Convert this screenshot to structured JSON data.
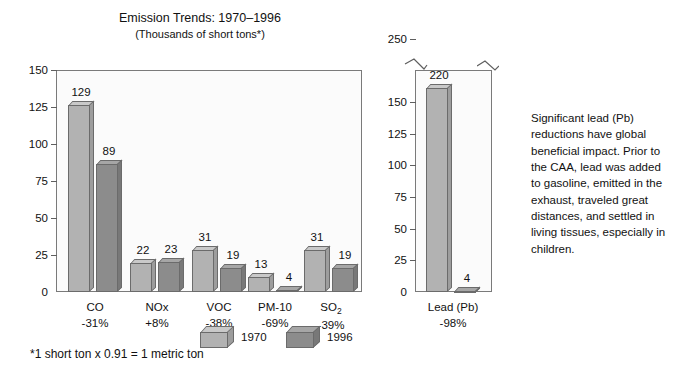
{
  "header": {
    "title": "Emission Trends: 1970–1996",
    "subtitle": "(Thousands of short tons*)"
  },
  "footnote": "*1 short ton x 0.91 = 1 metric ton",
  "side_note": "Significant lead (Pb) reductions have global beneficial impact. Prior to the CAA, lead was added to gasoline, emitted in the exhaust, traveled great distances, and settled in living tissues, especially in children.",
  "legend": {
    "items": [
      {
        "label": "1970",
        "color": "#b2b2b2"
      },
      {
        "label": "1996",
        "color": "#8c8c8c"
      }
    ]
  },
  "left_axis": {
    "ticks": [
      "0",
      "25",
      "50",
      "75",
      "100",
      "125",
      "150"
    ]
  },
  "right_axis": {
    "ticks": [
      "0",
      "25",
      "50",
      "75",
      "100",
      "125",
      "150",
      "250"
    ],
    "break_after": "150"
  },
  "categories": [
    {
      "name": "CO",
      "change": "-31%"
    },
    {
      "name": "NOx",
      "change": "+8%"
    },
    {
      "name": "VOC",
      "change": "-38%"
    },
    {
      "name": "PM-10",
      "change": "-69%"
    },
    {
      "name": "SO",
      "sub": "2",
      "change": "-39%"
    }
  ],
  "lead_category": {
    "name": "Lead (Pb)",
    "change": "-98%"
  },
  "values": {
    "co_1970": "129",
    "co_1996": "89",
    "nox_1970": "22",
    "nox_1996": "23",
    "voc_1970": "31",
    "voc_1996": "19",
    "pm10_1970": "13",
    "pm10_1996": "4",
    "so2_1970": "31",
    "so2_1996": "19",
    "lead_1970": "220",
    "lead_1996": "4"
  },
  "chart_data": {
    "type": "bar",
    "title": "Emission Trends: 1970–1996",
    "subtitle": "(Thousands of short tons*)",
    "ylabel": "Thousands of short tons",
    "xlabel": "",
    "grid": false,
    "legend_position": "bottom-center",
    "panels": [
      {
        "name": "main-pollutants",
        "ylim": [
          0,
          150
        ],
        "yticks": [
          0,
          25,
          50,
          75,
          100,
          125,
          150
        ],
        "categories": [
          "CO",
          "NOx",
          "VOC",
          "PM-10",
          "SO2"
        ],
        "category_changes": [
          "-31%",
          "+8%",
          "-38%",
          "-69%",
          "-39%"
        ],
        "series": [
          {
            "name": "1970",
            "values": [
              129,
              22,
              31,
              13,
              31
            ]
          },
          {
            "name": "1996",
            "values": [
              89,
              23,
              19,
              4,
              19
            ]
          }
        ]
      },
      {
        "name": "lead",
        "ylim": [
          0,
          250
        ],
        "yticks": [
          0,
          25,
          50,
          75,
          100,
          125,
          150,
          250
        ],
        "axis_break": true,
        "axis_break_between": [
          150,
          250
        ],
        "categories": [
          "Lead (Pb)"
        ],
        "category_changes": [
          "-98%"
        ],
        "series": [
          {
            "name": "1970",
            "values": [
              220
            ]
          },
          {
            "name": "1996",
            "values": [
              4
            ]
          }
        ]
      }
    ]
  }
}
